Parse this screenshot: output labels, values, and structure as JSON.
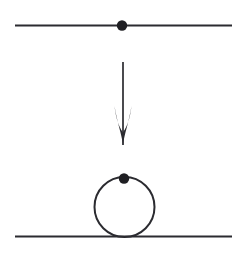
{
  "figure": {
    "kind": "feynman-diagram",
    "caption": "",
    "background_color": "#ffffff",
    "ink_color": "#2b2b30",
    "canvas": {
      "width": 248,
      "height": 253
    }
  },
  "top_panel": {
    "name": "tree-level-propagator",
    "line": {
      "label": "propagator-line",
      "x1": 15,
      "y1": 25.5,
      "x2": 232,
      "y2": 25.5,
      "stroke_width": 2.1,
      "color": "#2b2b30"
    },
    "vertex": {
      "label": "vertex-dot",
      "cx": 122,
      "cy": 25.5,
      "r": 5.2,
      "color": "#1f1f23"
    }
  },
  "arrow": {
    "name": "downward-arrow",
    "direction": "down",
    "shaft": {
      "x": 123,
      "y_start": 62,
      "y_end": 145,
      "stroke_width": 1.7,
      "color": "#2b2b30"
    },
    "head": {
      "tip_x": 123,
      "tip_y": 145,
      "left_barb_x": 114.5,
      "right_barb_x": 131.5,
      "barb_y": 106,
      "color": "#2b2b30"
    }
  },
  "bottom_panel": {
    "name": "tadpole-loop-correction",
    "line": {
      "label": "propagator-line",
      "x1": 15,
      "y1": 236.5,
      "x2": 232,
      "y2": 236.5,
      "stroke_width": 2.1,
      "color": "#2b2b30"
    },
    "loop": {
      "label": "loop-circle",
      "cx": 124.5,
      "cy": 207.0,
      "r": 30.0,
      "stroke_width": 2.0,
      "color": "#2b2b30"
    },
    "vertex": {
      "label": "vertex-dot",
      "cx": 124,
      "cy": 178.5,
      "r": 5.2,
      "color": "#1f1f23"
    }
  }
}
